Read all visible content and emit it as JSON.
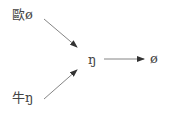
{
  "diagram": {
    "nodes": [
      {
        "id": "top",
        "label": "歐ø"
      },
      {
        "id": "bottom",
        "label": "牛ŋ"
      },
      {
        "id": "middle",
        "label": "ŋ"
      },
      {
        "id": "result",
        "label": "ø"
      }
    ],
    "edges": [
      {
        "from": "top",
        "to": "middle"
      },
      {
        "from": "bottom",
        "to": "middle"
      },
      {
        "from": "middle",
        "to": "result"
      }
    ],
    "colors": {
      "text": "#444444",
      "arrow": "#555555"
    }
  }
}
